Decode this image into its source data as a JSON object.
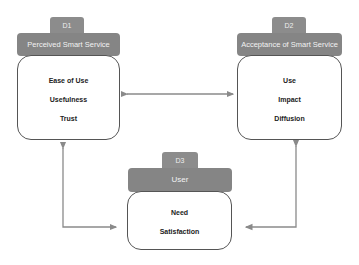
{
  "diagram": {
    "type": "framework",
    "nodes": [
      {
        "id": "D1",
        "tab": "D1",
        "title": "Perceived Smart Service Quality",
        "items": [
          "Ease of Use",
          "Usefulness",
          "Trust"
        ]
      },
      {
        "id": "D2",
        "tab": "D2",
        "title": "Acceptance of Smart Service",
        "items": [
          "Use",
          "Impact",
          "Diffusion"
        ]
      },
      {
        "id": "D3",
        "tab": "D3",
        "title": "User",
        "items": [
          "Need",
          "Satisfaction"
        ]
      }
    ],
    "edges": [
      {
        "from": "D1",
        "to": "D2",
        "bidirectional": true
      },
      {
        "from": "D3",
        "to": "D1",
        "bidirectional": true
      },
      {
        "from": "D3",
        "to": "D2",
        "bidirectional": true
      }
    ],
    "colors": {
      "header": "#858585",
      "tab": "#8c8c8c",
      "border": "#555555",
      "arrow": "#8a8a8a"
    }
  }
}
